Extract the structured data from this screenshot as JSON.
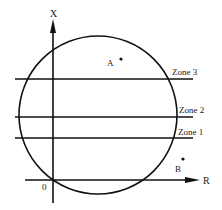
{
  "diagram": {
    "axes": {
      "vertical_label": "X",
      "horizontal_label": "R",
      "origin_label": "0"
    },
    "zones": [
      {
        "label": "Zone 3"
      },
      {
        "label": "Zone 2"
      },
      {
        "label": "Zone 1"
      }
    ],
    "points": [
      {
        "label": "A"
      },
      {
        "label": "B"
      }
    ],
    "colors": {
      "stroke": "#111111",
      "background": "#ffffff"
    }
  }
}
